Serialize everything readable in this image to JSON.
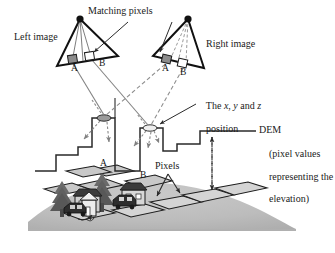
{
  "figure": {
    "type": "diagram",
    "topic": "stereo-photogrammetry-dem-generation",
    "labels": {
      "matching_pixels": "Matching pixels",
      "left_image": "Left image",
      "right_image": "Right image",
      "xyz_position_line1": "The x, y and z",
      "xyz_position_line2": "position",
      "xyz_italic_x": "x",
      "xyz_italic_y": "y",
      "xyz_italic_z": "z",
      "dem": "DEM",
      "dem_paren_line1": "(pixel values",
      "dem_paren_line2": "representing the",
      "dem_paren_line3": "elevation)",
      "pixels": "Pixels",
      "point_a_left": "A",
      "point_b_left": "B",
      "point_a_right": "A",
      "point_b_right": "B",
      "profile_a": "A",
      "profile_b": "B"
    },
    "colors": {
      "ink": "#1a1a1a",
      "outline": "#000000",
      "ray_solid": "#7d7d7d",
      "ray_dashed": "#8a8a8a",
      "pixel_a_fill": "#8c8c8c",
      "pixel_b_fill": "#ffffff",
      "terrain_fill": "#b9b9b9",
      "terrain_shadow": "#a9a9a9",
      "tile_fill": "#d0d0d0",
      "tree_fill": "#6e6e6e",
      "house_fill": "#e8e8e8",
      "car_fill": "#3a3a3a",
      "dem_line": "#2a2a2a",
      "arrow_gray": "#777777"
    },
    "geometry": {
      "left_camera_apex": [
        80,
        19
      ],
      "right_camera_apex": [
        188,
        19
      ],
      "ground_point_a": [
        109,
        119
      ],
      "ground_point_b": [
        155,
        128
      ],
      "dem_profile_steps": [
        [
          35,
          171
        ],
        [
          56,
          171
        ],
        [
          56,
          155
        ],
        [
          78,
          155
        ],
        [
          78,
          147
        ],
        [
          92,
          147
        ],
        [
          92,
          118
        ],
        [
          115,
          118
        ],
        [
          115,
          171
        ],
        [
          140,
          171
        ],
        [
          140,
          128
        ],
        [
          163,
          128
        ],
        [
          163,
          151
        ],
        [
          177,
          151
        ],
        [
          177,
          144
        ],
        [
          200,
          144
        ],
        [
          200,
          131
        ],
        [
          229,
          131
        ]
      ],
      "dem_callout_arrow_x": 212,
      "dem_callout_arrow_top": 136,
      "dem_callout_arrow_bottom": 188
    }
  }
}
